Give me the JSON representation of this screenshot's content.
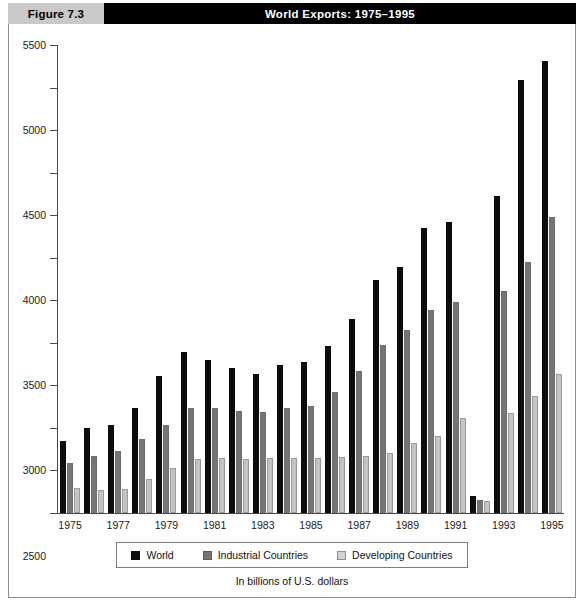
{
  "figure": {
    "tag": "Figure 7.3",
    "title": "World Exports: 1975–1995",
    "caption": "In billions of U.S. dollars"
  },
  "legend": {
    "position": "bottom",
    "items": [
      {
        "label": "World",
        "color": "#0d0d0d",
        "swatch": "series-0-swatch"
      },
      {
        "label": "Industrial Countries",
        "color": "#757575",
        "swatch": "series-1-swatch"
      },
      {
        "label": "Developing Countries",
        "color": "#d2d2d2",
        "swatch": "series-2-swatch"
      }
    ]
  },
  "chart_data": {
    "type": "bar",
    "title": "World Exports: 1975–1995",
    "xlabel": "",
    "ylabel": "",
    "unit_note": "In billions of U.S. dollars",
    "ylim": [
      0,
      5500
    ],
    "yticks": [
      0,
      500,
      1000,
      1500,
      2000,
      2500,
      3000,
      3500,
      4000,
      4500,
      5000,
      5500
    ],
    "ytick_labels": [
      "0",
      "500",
      "1000",
      "1500",
      "2000",
      "2500",
      "3000",
      "3500",
      "4000",
      "4500",
      "5000",
      "5500"
    ],
    "grid": false,
    "legend_position": "bottom",
    "categories": [
      1975,
      1976,
      1977,
      1978,
      1979,
      1980,
      1981,
      1982,
      1983,
      1984,
      1985,
      1986,
      1987,
      1988,
      1989,
      1990,
      1991,
      1992,
      1993,
      1994,
      1995
    ],
    "visible_xtick_labels": [
      "1975",
      "1977",
      "1979",
      "1981",
      "1983",
      "1985",
      "1987",
      "1989",
      "1991",
      "1993",
      "1995"
    ],
    "series": [
      {
        "name": "World",
        "color": "#0d0d0d",
        "values": [
          850,
          1000,
          1040,
          1230,
          1610,
          1890,
          1800,
          1710,
          1630,
          1740,
          1780,
          1960,
          2280,
          2740,
          2890,
          3350,
          3420,
          200,
          3720,
          5090,
          5310
        ]
      },
      {
        "name": "Industrial Countries",
        "color": "#757575",
        "values": [
          590,
          670,
          730,
          870,
          1040,
          1240,
          1240,
          1200,
          1190,
          1230,
          1260,
          1420,
          1670,
          1970,
          2150,
          2390,
          2480,
          150,
          2610,
          2950,
          3480
        ]
      },
      {
        "name": "Developing Countries",
        "color": "#d2d2d2",
        "values": [
          290,
          270,
          280,
          400,
          530,
          640,
          650,
          640,
          650,
          650,
          650,
          660,
          670,
          700,
          820,
          910,
          1120,
          140,
          1180,
          1370,
          1630
        ]
      }
    ]
  }
}
